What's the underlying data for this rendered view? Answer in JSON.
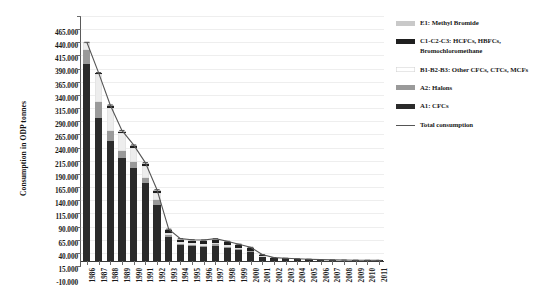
{
  "chart_data": {
    "type": "bar",
    "title": "",
    "subtitle": "",
    "xlabel": "",
    "ylabel": "Consumption in ODP tonnes",
    "ylim": [
      -10000,
      465000
    ],
    "ytick_step": 25000,
    "ytick_labels": [
      "465.000",
      "440.000",
      "415.000",
      "390.000",
      "365.000",
      "340.000",
      "315.000",
      "290.000",
      "265.000",
      "240.000",
      "215.000",
      "190.000",
      "165.000",
      "140.000",
      "115.000",
      "90.000",
      "65.000",
      "40.000",
      "15.000",
      "-10.000"
    ],
    "ytick_values": [
      465000,
      440000,
      415000,
      390000,
      365000,
      340000,
      315000,
      290000,
      265000,
      240000,
      215000,
      190000,
      165000,
      140000,
      115000,
      90000,
      65000,
      40000,
      15000,
      -10000
    ],
    "grid": true,
    "stacked": true,
    "legend_position": "right",
    "categories": [
      "1986",
      "1987",
      "1988",
      "1989",
      "1990",
      "1991",
      "1992",
      "1993",
      "1994",
      "1995",
      "1996",
      "1997",
      "1998",
      "1999",
      "2000",
      "2001",
      "2002",
      "2003",
      "2004",
      "2005",
      "2006",
      "2007",
      "2008",
      "2009",
      "2010",
      "2011"
    ],
    "series": [
      {
        "name": "A1: CFCs",
        "color": "#2b2b2b",
        "values": [
          373000,
          272000,
          227000,
          196000,
          176000,
          148000,
          106000,
          46000,
          30000,
          28000,
          27000,
          29000,
          25000,
          21000,
          17000,
          7000,
          3000,
          2500,
          2000,
          1500,
          1000,
          600,
          400,
          300,
          200,
          150
        ]
      },
      {
        "name": "A2: Halons",
        "color": "#9a9a9a",
        "values": [
          27000,
          30000,
          19000,
          13000,
          11000,
          10000,
          9000,
          3000,
          2000,
          2000,
          2000,
          2000,
          2000,
          1500,
          1000,
          500,
          300,
          200,
          200,
          150,
          100,
          80,
          60,
          50,
          40,
          30
        ]
      },
      {
        "name": "B1-B2-B3: Other CFCs, CTCs, MCFs",
        "color": "#ededed",
        "values": [
          13000,
          52000,
          45000,
          33000,
          27000,
          22000,
          13000,
          4000,
          3000,
          3000,
          3000,
          3000,
          2500,
          2000,
          1500,
          700,
          400,
          300,
          200,
          150,
          100,
          80,
          60,
          50,
          40,
          30
        ]
      },
      {
        "name": "C1-C2-C3: HCFCs, HBFCs, Bromochloromethane",
        "color": "#1f1f1f",
        "values": [
          1000,
          2000,
          3000,
          3500,
          4000,
          4500,
          5000,
          5000,
          5000,
          5000,
          5500,
          6000,
          6000,
          5500,
          5000,
          3000,
          2000,
          1500,
          1200,
          1000,
          900,
          800,
          700,
          600,
          500,
          400
        ]
      },
      {
        "name": "E1: Methyl Bromide",
        "color": "#c9c9c9",
        "values": [
          1000,
          1500,
          2000,
          2000,
          2000,
          2000,
          2000,
          2000,
          2000,
          2000,
          2000,
          2000,
          1500,
          1500,
          1000,
          500,
          300,
          200,
          150,
          100,
          80,
          60,
          50,
          40,
          30,
          20
        ]
      }
    ],
    "total_line": {
      "name": "Total consumption",
      "color": "#555555",
      "values": [
        415000,
        357500,
        296000,
        247500,
        220000,
        186500,
        135000,
        60000,
        42000,
        40000,
        39500,
        42000,
        37000,
        31500,
        25500,
        11700,
        6000,
        4700,
        3750,
        2900,
        2180,
        1620,
        1270,
        1040,
        810,
        630
      ]
    }
  },
  "legend": {
    "items": [
      {
        "label": "E1: Methyl Bromide",
        "swatch": "#c9c9c9",
        "type": "box"
      },
      {
        "label": "C1-C2-C3: HCFCs, HBFCs, Bromochloromethane",
        "swatch": "#1f1f1f",
        "type": "box"
      },
      {
        "label": "B1-B2-B3: Other CFCs, CTCs, MCFs",
        "swatch": "#ffffff",
        "type": "box"
      },
      {
        "label": "A2: Halons",
        "swatch": "#9a9a9a",
        "type": "box"
      },
      {
        "label": "A1: CFCs",
        "swatch": "#2b2b2b",
        "type": "box"
      },
      {
        "label": "Total consumption",
        "swatch": "#555555",
        "type": "line"
      }
    ]
  }
}
